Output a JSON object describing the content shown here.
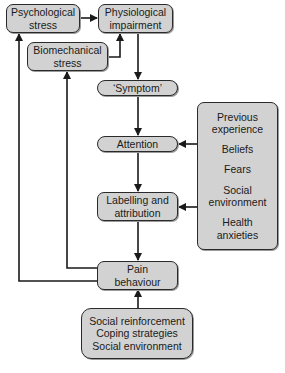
{
  "diagram": {
    "nodes": {
      "psych": {
        "line1": "Psychological",
        "line2": "stress"
      },
      "physio": {
        "line1": "Physiological",
        "line2": "impairment"
      },
      "biomech": {
        "line1": "Biomechanical",
        "line2": "stress"
      },
      "symptom": {
        "label": "‘Symptom’"
      },
      "attention": {
        "label": "Attention"
      },
      "labelling": {
        "line1": "Labelling and",
        "line2": "attribution"
      },
      "pain": {
        "line1": "Pain",
        "line2": "behaviour"
      },
      "factors": {
        "items": [
          {
            "line1": "Previous",
            "line2": "experience"
          },
          {
            "line1": "Beliefs",
            "line2": ""
          },
          {
            "line1": "Fears",
            "line2": ""
          },
          {
            "line1": "Social",
            "line2": "environment"
          },
          {
            "line1": "Health",
            "line2": "anxieties"
          }
        ]
      },
      "social": {
        "lines": [
          "Social reinforcement",
          "Coping strategies",
          "Social environment"
        ]
      }
    },
    "edges": [
      {
        "from": "psych",
        "to": "physio"
      },
      {
        "from": "biomech",
        "to": "physio"
      },
      {
        "from": "physio",
        "to": "symptom"
      },
      {
        "from": "symptom",
        "to": "attention"
      },
      {
        "from": "factors",
        "to": "attention"
      },
      {
        "from": "attention",
        "to": "labelling"
      },
      {
        "from": "factors",
        "to": "labelling"
      },
      {
        "from": "labelling",
        "to": "pain"
      },
      {
        "from": "social",
        "to": "pain"
      },
      {
        "from": "pain",
        "to": "biomech"
      },
      {
        "from": "pain",
        "to": "psych"
      }
    ],
    "colors": {
      "box_fill": "#d2d2d2",
      "stroke": "#1a1a1a",
      "background": "#ffffff"
    }
  }
}
